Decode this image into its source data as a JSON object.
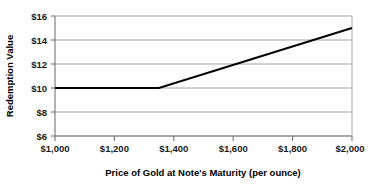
{
  "chart_data": {
    "type": "line",
    "title": "",
    "xlabel": "Price of Gold at Note's Maturity (per ounce)",
    "ylabel": "Redemption Value",
    "xlim": [
      1000,
      2000
    ],
    "ylim": [
      6,
      16
    ],
    "xticks": [
      1000,
      1200,
      1400,
      1600,
      1800,
      2000
    ],
    "yticks": [
      6,
      8,
      10,
      12,
      14,
      16
    ],
    "xtick_labels": [
      "$1,000",
      "$1,200",
      "$1,400",
      "$1,600",
      "$1,800",
      "$2,000"
    ],
    "ytick_labels": [
      "$6",
      "$8",
      "$10",
      "$12",
      "$14",
      "$16"
    ],
    "grid": "horizontal",
    "legend": "none",
    "series": [
      {
        "name": "Redemption Value",
        "color": "#000000",
        "x": [
          1000,
          1350,
          2000
        ],
        "values": [
          10,
          10,
          15
        ]
      }
    ],
    "annotations": []
  },
  "style": {
    "line_color": "#000000",
    "grid_color": "#a6a6a6",
    "axis_color": "#808080",
    "background": "#ffffff",
    "text_color": "#1a1a1a"
  }
}
